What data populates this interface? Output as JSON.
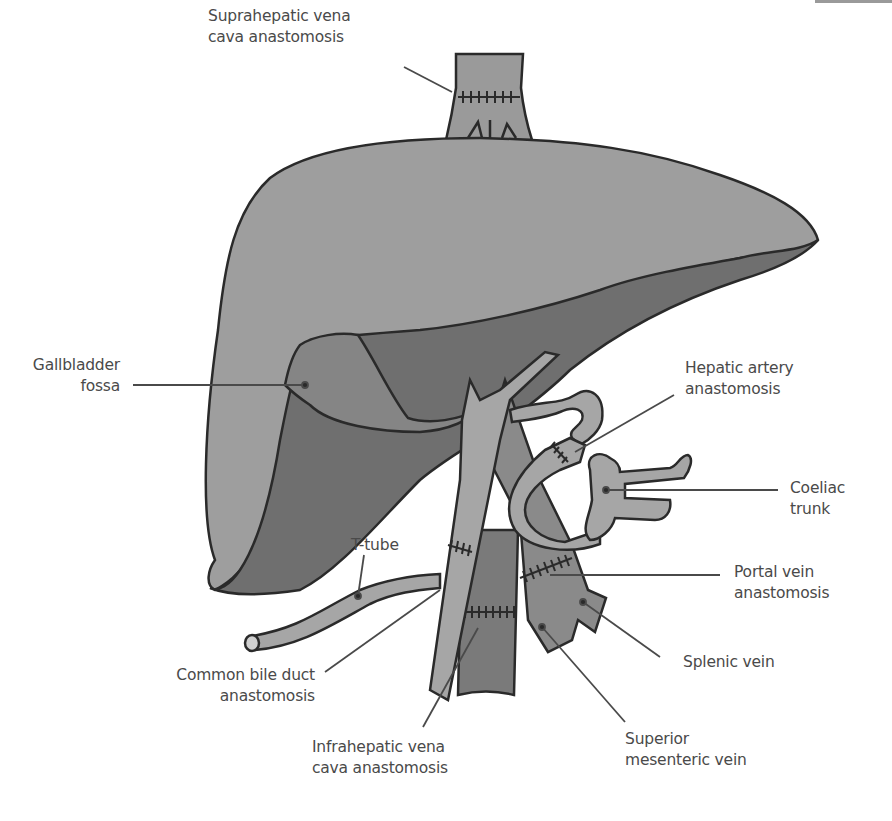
{
  "figure": {
    "colors": {
      "liver_light": "#9e9e9e",
      "liver_dark": "#6f6f6f",
      "gallbladder": "#858585",
      "vessel_light": "#a6a6a6",
      "vessel_mid": "#8a8a8a",
      "vessel_dark": "#7a7a7a",
      "outline": "#2a2a2a",
      "leader": "#4a4a4a",
      "text": "#4a4a4a"
    }
  },
  "labels": {
    "suprahepatic": {
      "line1": "Suprahepatic vena",
      "line2": "cava anastomosis"
    },
    "gallbladder": {
      "line1": "Gallbladder",
      "line2": "fossa"
    },
    "hepatic_artery": {
      "line1": "Hepatic artery",
      "line2": "anastomosis"
    },
    "coeliac": {
      "line1": "Coeliac",
      "line2": "trunk"
    },
    "t_tube": {
      "line1": "T-tube"
    },
    "portal_vein": {
      "line1": "Portal vein",
      "line2": "anastomosis"
    },
    "common_bile_duct": {
      "line1": "Common bile duct",
      "line2": "anastomosis"
    },
    "splenic_vein": {
      "line1": "Splenic vein"
    },
    "infrahepatic": {
      "line1": "Infrahepatic vena",
      "line2": "cava anastomosis"
    },
    "superior_mesenteric": {
      "line1": "Superior",
      "line2": "mesenteric vein"
    }
  }
}
